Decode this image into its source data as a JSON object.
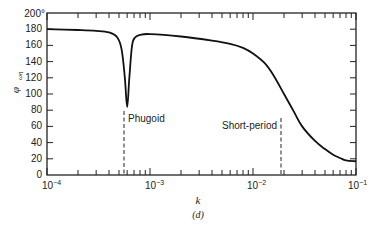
{
  "chart_data": {
    "type": "line",
    "title": "",
    "caption": "(d)",
    "xlabel": "k",
    "ylabel": "φ(ωη)",
    "xscale": "log",
    "xlim": [
      0.0001,
      0.1
    ],
    "ylim": [
      0,
      200
    ],
    "x_tick_labels": [
      "10^-4",
      "10^-3",
      "10^-2",
      "10^-1"
    ],
    "y_tick_labels": [
      "0",
      "20",
      "40",
      "60",
      "80",
      "100",
      "120",
      "140",
      "160",
      "180",
      "200°"
    ],
    "grid": false,
    "legend": null,
    "series": [
      {
        "name": "phase",
        "x": [
          0.0001,
          0.0002,
          0.0003,
          0.0004,
          0.00048,
          0.00053,
          0.00057,
          0.0006,
          0.00063,
          0.00067,
          0.00072,
          0.0008,
          0.001,
          0.002,
          0.004,
          0.006,
          0.008,
          0.01,
          0.013,
          0.016,
          0.02,
          0.025,
          0.03,
          0.04,
          0.05,
          0.06,
          0.07,
          0.08,
          0.1
        ],
        "y": [
          180,
          179,
          178,
          176,
          170,
          155,
          120,
          84,
          120,
          160,
          170,
          173,
          174,
          171,
          166,
          162,
          157,
          150,
          138,
          122,
          100,
          78,
          60,
          42,
          32,
          25,
          21,
          18,
          17
        ]
      }
    ],
    "annotations": [
      {
        "label": "Phugoid",
        "x": 0.0006,
        "type": "dashed-vertical",
        "y_top": 82
      },
      {
        "label": "Short-period",
        "x": 0.0185,
        "type": "dashed-vertical",
        "y_top": 105
      }
    ]
  },
  "labels": {
    "ylabel_main": "φ",
    "ylabel_sub": "ωη",
    "xlabel": "k",
    "caption": "(d)",
    "phugoid": "Phugoid",
    "short_period": "Short-period",
    "y0": "0",
    "y20": "20",
    "y40": "40",
    "y60": "60",
    "y80": "80",
    "y100": "100",
    "y120": "120",
    "y140": "140",
    "y160": "160",
    "y180": "180",
    "y200": "200°",
    "x_m4": "10",
    "x_m4_exp": "−4",
    "x_m3": "10",
    "x_m3_exp": "−3",
    "x_m2": "10",
    "x_m2_exp": "−2",
    "x_m1": "10",
    "x_m1_exp": "−1"
  }
}
